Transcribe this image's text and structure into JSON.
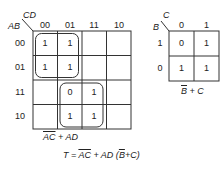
{
  "kmap4": {
    "row_var": "AB",
    "col_var": "CD",
    "col_headers": [
      "00",
      "01",
      "11",
      "10"
    ],
    "row_headers": [
      "00",
      "01",
      "11",
      "10"
    ],
    "cells": [
      [
        "1",
        "1",
        "",
        ""
      ],
      [
        "1",
        "1",
        "",
        ""
      ],
      [
        "",
        "0",
        "1",
        ""
      ],
      [
        "",
        "1",
        "1",
        ""
      ]
    ],
    "groups": [
      {
        "rows": [
          0,
          1
        ],
        "cols": [
          0,
          1
        ]
      },
      {
        "rows": [
          2,
          3
        ],
        "cols": [
          1,
          2
        ]
      }
    ],
    "result_terms": [
      {
        "text": "AC",
        "overline": true
      },
      {
        "text": " + AD",
        "overline": false
      }
    ]
  },
  "kmap2": {
    "row_var": "B",
    "col_var": "C",
    "col_headers": [
      "0",
      "1"
    ],
    "row_headers": [
      "1",
      "0"
    ],
    "cells": [
      [
        "0",
        "1"
      ],
      [
        "1",
        "1"
      ]
    ],
    "result_terms": [
      {
        "text": "B",
        "overline": true
      },
      {
        "text": " + C",
        "overline": false
      }
    ]
  },
  "final_expression": {
    "prefix": "T = ",
    "term1": "AC",
    "middle": " + AD (",
    "term2": "B",
    "suffix": "+C)"
  }
}
